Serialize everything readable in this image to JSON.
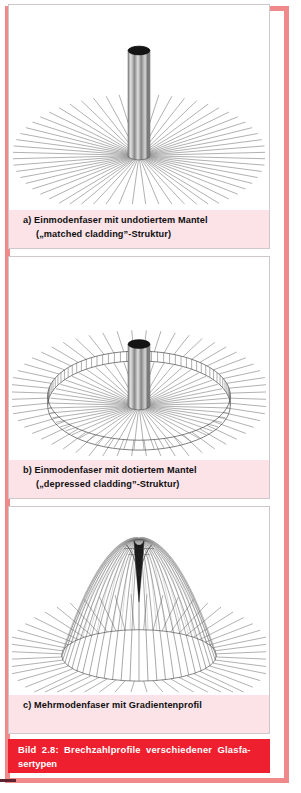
{
  "figure": {
    "id": "Bild 2.8",
    "caption_line1": "Bild 2.8: Brechzahlprofile verschiedener Glasfa-",
    "caption_line2": "sertypen",
    "caption_full": "Bild 2.8: Brechzahlprofile verschiedener Glasfasertypen"
  },
  "colors": {
    "frame_pink": "#f08a8a",
    "caption_bar_red": "#ee2030",
    "panel_caption_bg": "#fbe3e8",
    "panel_border": "#cfc7cb",
    "line_ink": "#4a4a4a",
    "cylinder_dark": "#111111",
    "page_white": "#ffffff"
  },
  "panels": [
    {
      "key": "a",
      "label": "a)",
      "caption_line1": "Einmodenfaser mit undotiertem Mantel",
      "caption_line2": "(„matched cladding”-Struktur)",
      "caption_full": "a) Einmodenfaser mit undotiertem Mantel („matched cladding”-Struktur)",
      "art_name": "matched-cladding-profile",
      "art_description": "step-index core cylinder rising from a flat cladding plane drawn as radial fan lines"
    },
    {
      "key": "b",
      "label": "b)",
      "caption_line1": "Einmodenfaser mit dotiertem Mantel",
      "caption_line2": "(„depressed cladding”-Struktur)",
      "caption_full": "b) Einmodenfaser mit dotiertem Mantel („depressed cladding”-Struktur)",
      "art_name": "depressed-cladding-profile",
      "art_description": "step-index core cylinder surrounded by a depressed annular trough drawn as two ellipses with vertical rulings, outside flat plane as radial fan lines"
    },
    {
      "key": "c",
      "label": "c)",
      "caption_line1": "Mehrmodenfaser mit Gradientenprofil",
      "caption_line2": "",
      "caption_full": "c) Mehrmodenfaser mit Gradientenprofil",
      "art_name": "graded-index-profile",
      "art_description": "parabolic graded-index dome drawn with meridian lines converging at a dark peak, surrounded by a flat cladding plane of radial fan lines"
    }
  ]
}
